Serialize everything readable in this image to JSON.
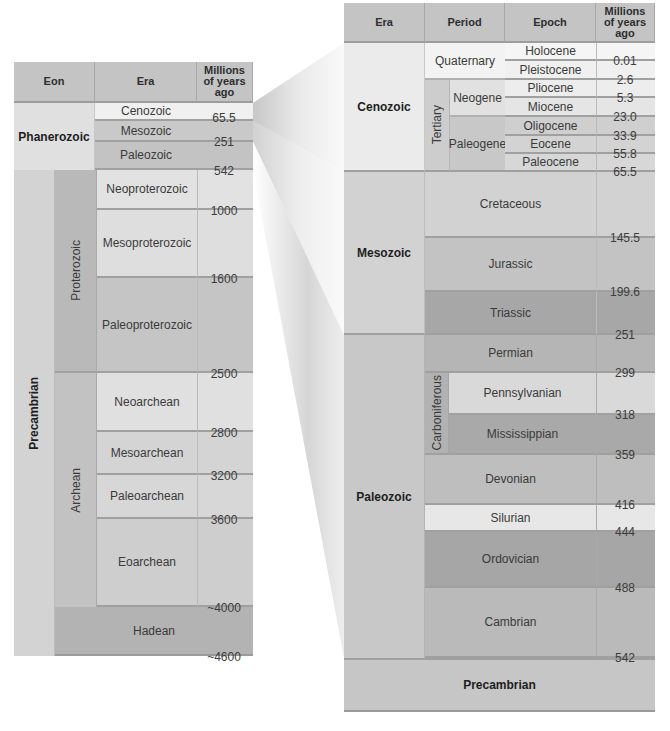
{
  "left_table": {
    "headers": {
      "eon": "Eon",
      "era": "Era",
      "ma": "Millions of years ago"
    },
    "eons": {
      "phanerozoic": "Phanerozoic",
      "precambrian": "Precambrian"
    },
    "sub_eons": {
      "proterozoic": "Proterozoic",
      "archean": "Archean"
    },
    "eras": [
      {
        "name": "Cenozoic"
      },
      {
        "name": "Mesozoic"
      },
      {
        "name": "Paleozoic"
      },
      {
        "name": "Neoproterozoic"
      },
      {
        "name": "Mesoproterozoic"
      },
      {
        "name": "Paleoproterozoic"
      },
      {
        "name": "Neoarchean"
      },
      {
        "name": "Mesoarchean"
      },
      {
        "name": "Paleoarchean"
      },
      {
        "name": "Eoarchean"
      },
      {
        "name": "Hadean"
      }
    ],
    "boundaries": [
      "65.5",
      "251",
      "542",
      "1000",
      "1600",
      "2500",
      "2800",
      "3200",
      "3600",
      "~4000",
      "~4600"
    ]
  },
  "right_table": {
    "headers": {
      "era": "Era",
      "period": "Period",
      "epoch": "Epoch",
      "ma": "Millions of years ago"
    },
    "eras": {
      "cenozoic": "Cenozoic",
      "mesozoic": "Mesozoic",
      "paleozoic": "Paleozoic",
      "precambrian": "Precambrian"
    },
    "cenozoic_periods": {
      "quaternary": "Quaternary",
      "tertiary": "Tertiary",
      "neogene": "Neogene",
      "paleogene": "Paleogene"
    },
    "epochs": [
      "Holocene",
      "Pleistocene",
      "Pliocene",
      "Miocene",
      "Oligocene",
      "Eocene",
      "Paleocene"
    ],
    "periods": {
      "cretaceous": "Cretaceous",
      "jurassic": "Jurassic",
      "triassic": "Triassic",
      "permian": "Permian",
      "carboniferous": "Carboniferous",
      "pennsylvanian": "Pennsylvanian",
      "mississippian": "Mississippian",
      "devonian": "Devonian",
      "silurian": "Silurian",
      "ordovician": "Ordovician",
      "cambrian": "Cambrian"
    },
    "boundaries": [
      "0.01",
      "2.6",
      "5.3",
      "23.0",
      "33.9",
      "55.8",
      "65.5",
      "145.5",
      "199.6",
      "251",
      "299",
      "318",
      "359",
      "416",
      "444",
      "488",
      "542"
    ]
  },
  "colors": {
    "header": "#c4c4c4",
    "lightest": "#f0f0f0",
    "light": "#e4e4e4",
    "mid_light": "#d6d6d6",
    "mid": "#c8c8c8",
    "mid_dark": "#b8b8b8",
    "dark": "#a9a9a9"
  }
}
